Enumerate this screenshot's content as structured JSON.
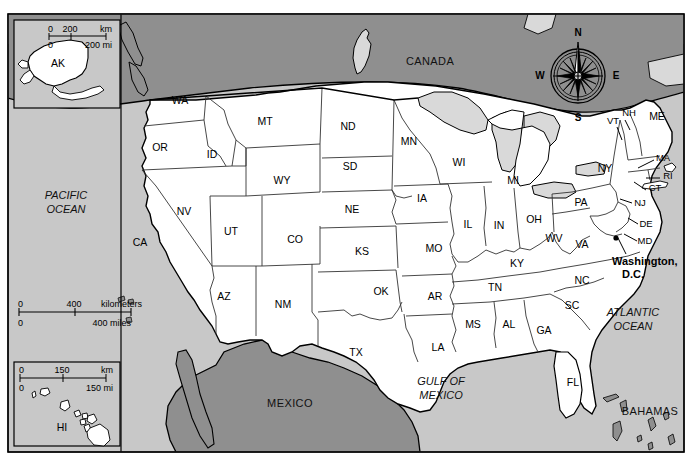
{
  "map": {
    "title": "United States reference map",
    "colors": {
      "land_us": "#ffffff",
      "ocean": "#c8c8c8",
      "canada_mexico": "#8f8f8f",
      "lakes": "#d9d9d9",
      "border": "#000000",
      "state_line": "#333333",
      "page_background": "#ffffff"
    },
    "frame": {
      "x": 8,
      "y": 14,
      "width": 676,
      "height": 438
    },
    "labels": {
      "canada": "CANADA",
      "mexico": "MEXICO",
      "bahamas": "BAHAMAS",
      "pacific_ocean": [
        "PACIFIC",
        "OCEAN"
      ],
      "atlantic_ocean": [
        "ATLANTIC",
        "OCEAN"
      ],
      "gulf_of_mexico": [
        "GULF OF",
        "MEXICO"
      ],
      "capital": [
        "Washington,",
        "D.C."
      ]
    },
    "compass": {
      "name": "compass-rose",
      "north": "N",
      "south": "S",
      "east": "E",
      "west": "W",
      "cx": 578,
      "cy": 76,
      "r": 27
    },
    "scalebars": [
      {
        "name": "main-scale-bar",
        "x": 18,
        "y": 300,
        "length": 72,
        "km_zero": "0",
        "km_mid": "400",
        "km_unit": "kilometers",
        "mi_zero": "0",
        "mi_label": "400 miles"
      },
      {
        "name": "alaska-scale-bar",
        "x": 48,
        "y": 29,
        "length": 52,
        "km_zero": "0",
        "km_mid": "200",
        "km_unit": "km",
        "mi_zero": "0",
        "mi_label": "200 mi"
      },
      {
        "name": "hawaii-scale-bar",
        "x": 19,
        "y": 370,
        "length": 72,
        "km_zero": "0",
        "km_mid": "150",
        "km_unit": "km",
        "mi_zero": "0",
        "mi_label": "150 mi"
      }
    ],
    "insets": [
      {
        "name": "alaska-inset",
        "label": "AK",
        "x": 14,
        "y": 20,
        "width": 106,
        "height": 88
      },
      {
        "name": "hawaii-inset",
        "label": "HI",
        "x": 14,
        "y": 362,
        "width": 106,
        "height": 84
      }
    ],
    "states": [
      {
        "abbr": "WA",
        "x": 180,
        "y": 101
      },
      {
        "abbr": "OR",
        "x": 160,
        "y": 148
      },
      {
        "abbr": "ID",
        "x": 212,
        "y": 155
      },
      {
        "abbr": "MT",
        "x": 265,
        "y": 122
      },
      {
        "abbr": "ND",
        "x": 348,
        "y": 127
      },
      {
        "abbr": "SD",
        "x": 350,
        "y": 167
      },
      {
        "abbr": "NE",
        "x": 352,
        "y": 210
      },
      {
        "abbr": "WY",
        "x": 282,
        "y": 181
      },
      {
        "abbr": "UT",
        "x": 231,
        "y": 232
      },
      {
        "abbr": "NV",
        "x": 184,
        "y": 212
      },
      {
        "abbr": "CA",
        "x": 140,
        "y": 243
      },
      {
        "abbr": "AZ",
        "x": 224,
        "y": 297
      },
      {
        "abbr": "NM",
        "x": 283,
        "y": 305
      },
      {
        "abbr": "CO",
        "x": 295,
        "y": 240
      },
      {
        "abbr": "KS",
        "x": 362,
        "y": 252
      },
      {
        "abbr": "OK",
        "x": 381,
        "y": 292
      },
      {
        "abbr": "TX",
        "x": 356,
        "y": 353
      },
      {
        "abbr": "MN",
        "x": 409,
        "y": 142
      },
      {
        "abbr": "IA",
        "x": 422,
        "y": 199
      },
      {
        "abbr": "MO",
        "x": 434,
        "y": 249
      },
      {
        "abbr": "AR",
        "x": 435,
        "y": 297
      },
      {
        "abbr": "LA",
        "x": 438,
        "y": 348
      },
      {
        "abbr": "WI",
        "x": 459,
        "y": 163
      },
      {
        "abbr": "IL",
        "x": 468,
        "y": 225
      },
      {
        "abbr": "IN",
        "x": 499,
        "y": 226
      },
      {
        "abbr": "MI",
        "x": 513,
        "y": 181
      },
      {
        "abbr": "OH",
        "x": 534,
        "y": 220
      },
      {
        "abbr": "KY",
        "x": 517,
        "y": 264
      },
      {
        "abbr": "TN",
        "x": 495,
        "y": 288
      },
      {
        "abbr": "MS",
        "x": 473,
        "y": 325
      },
      {
        "abbr": "AL",
        "x": 509,
        "y": 325
      },
      {
        "abbr": "GA",
        "x": 544,
        "y": 331
      },
      {
        "abbr": "FL",
        "x": 573,
        "y": 383
      },
      {
        "abbr": "SC",
        "x": 572,
        "y": 306
      },
      {
        "abbr": "NC",
        "x": 582,
        "y": 281
      },
      {
        "abbr": "VA",
        "x": 582,
        "y": 245
      },
      {
        "abbr": "WV",
        "x": 554,
        "y": 239
      },
      {
        "abbr": "PA",
        "x": 581,
        "y": 203
      },
      {
        "abbr": "NY",
        "x": 605,
        "y": 169
      },
      {
        "abbr": "VT",
        "x": 613,
        "y": 121
      },
      {
        "abbr": "NH",
        "x": 629,
        "y": 113
      },
      {
        "abbr": "ME",
        "x": 657,
        "y": 117
      },
      {
        "abbr": "MA",
        "x": 663,
        "y": 158
      },
      {
        "abbr": "RI",
        "x": 668,
        "y": 176
      },
      {
        "abbr": "CT",
        "x": 655,
        "y": 188
      },
      {
        "abbr": "NJ",
        "x": 640,
        "y": 203
      },
      {
        "abbr": "DE",
        "x": 646,
        "y": 224
      },
      {
        "abbr": "MD",
        "x": 645,
        "y": 241
      }
    ]
  }
}
